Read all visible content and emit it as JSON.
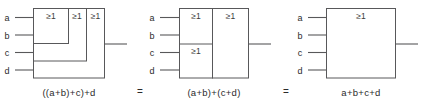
{
  "figure": {
    "gate_symbol": "≥1",
    "equals_symbol": "=",
    "colors": {
      "stroke": "#58585a",
      "text": "#2b2b2b",
      "background": "#ffffff"
    }
  },
  "inputs": {
    "labels": [
      "a",
      "b",
      "c",
      "d"
    ]
  },
  "diagrams": [
    {
      "id": "nested-or",
      "caption": "((a+b)+c)+d",
      "input_labels": [
        "a",
        "b",
        "c",
        "d"
      ],
      "gates": [
        {
          "label": "≥1",
          "inputs": [
            "a",
            "b"
          ],
          "name": "or-gate-ab"
        },
        {
          "label": "≥1",
          "inputs": [
            "(a+b)",
            "c"
          ],
          "name": "or-gate-abc"
        },
        {
          "label": "≥1",
          "inputs": [
            "((a+b)+c)",
            "d"
          ],
          "name": "or-gate-abcd"
        }
      ],
      "output": "((a+b)+c)+d"
    },
    {
      "id": "paired-or",
      "caption": "(a+b)+(c+d)",
      "input_labels": [
        "a",
        "b",
        "c",
        "d"
      ],
      "gates": [
        {
          "label": "≥1",
          "inputs": [
            "a",
            "b"
          ],
          "name": "or-gate-ab"
        },
        {
          "label": "≥1",
          "inputs": [
            "c",
            "d"
          ],
          "name": "or-gate-cd"
        },
        {
          "label": "≥1",
          "inputs": [
            "(a+b)",
            "(c+d)"
          ],
          "name": "or-gate-combine"
        }
      ],
      "output": "(a+b)+(c+d)"
    },
    {
      "id": "single-or",
      "caption": "a+b+c+d",
      "input_labels": [
        "a",
        "b",
        "c",
        "d"
      ],
      "gates": [
        {
          "label": "≥1",
          "inputs": [
            "a",
            "b",
            "c",
            "d"
          ],
          "name": "or-gate-4input"
        }
      ],
      "output": "a+b+c+d"
    }
  ],
  "relations": [
    {
      "symbol": "=",
      "between": [
        "((a+b)+c)+d",
        "(a+b)+(c+d)"
      ]
    },
    {
      "symbol": "=",
      "between": [
        "(a+b)+(c+d)",
        "a+b+c+d"
      ]
    }
  ]
}
